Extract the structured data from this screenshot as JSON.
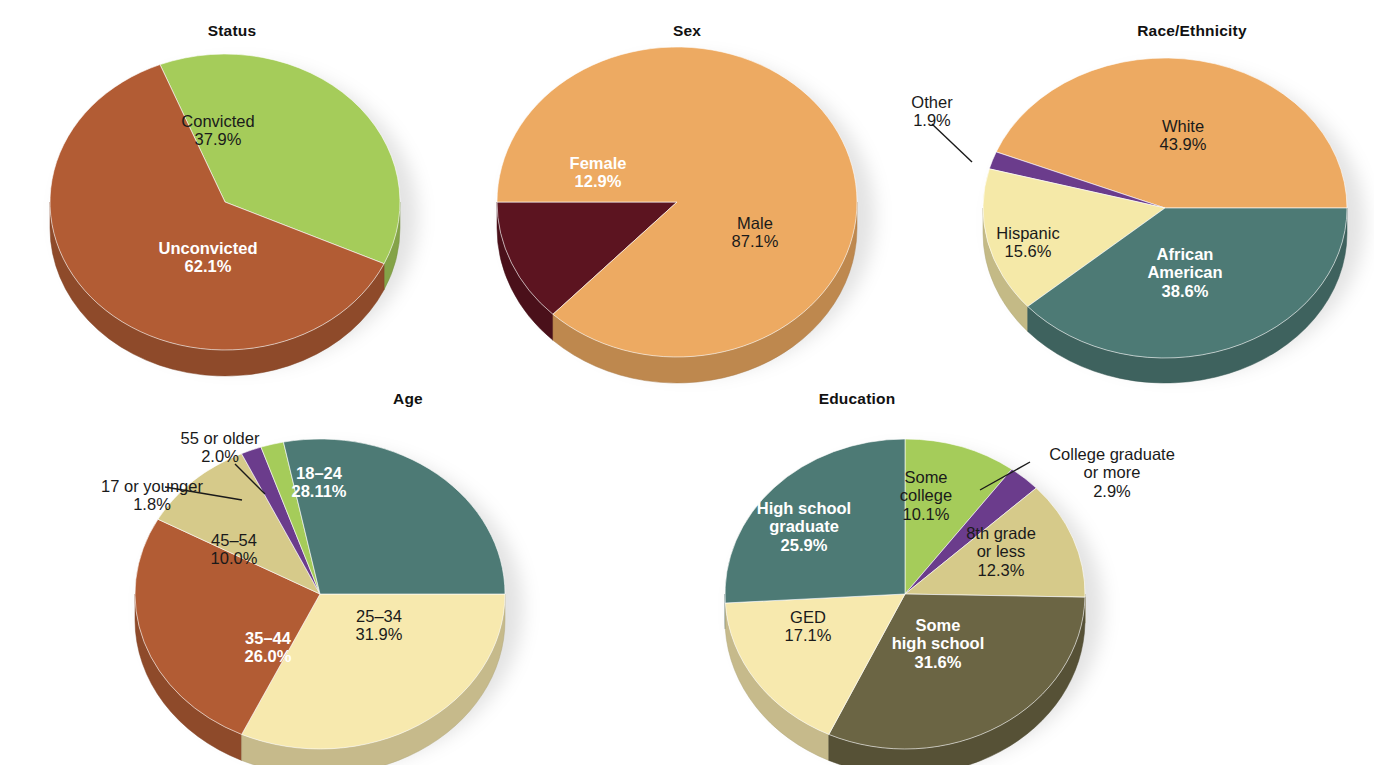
{
  "figure": {
    "background": "#ffffff",
    "palette": {
      "green": "#a5cc5a",
      "brick": "#b25c34",
      "orange": "#edaa62",
      "maroon": "#5c1420",
      "cream": "#f5e9a8",
      "teal": "#4d7a75",
      "purple": "#6b3c8c",
      "khaki": "#d6ca8a",
      "olive": "#6b6544",
      "pale_yellow": "#f7e9ae"
    }
  },
  "chart_data": [
    {
      "type": "pie",
      "id": "status",
      "title": "Status",
      "categories": [
        "Convicted",
        "Unconvicted"
      ],
      "values": [
        37.9,
        62.1
      ],
      "labels": [
        "37.9%",
        "62.1%"
      ],
      "colors": [
        "#a5cc5a",
        "#b25c34"
      ],
      "legend": "none"
    },
    {
      "type": "pie",
      "id": "sex",
      "title": "Sex",
      "categories": [
        "Female",
        "Male"
      ],
      "values": [
        12.9,
        87.1
      ],
      "labels": [
        "12.9%",
        "87.1%"
      ],
      "colors": [
        "#5c1420",
        "#edaa62"
      ],
      "legend": "none"
    },
    {
      "type": "pie",
      "id": "race_ethnicity",
      "title": "Race/Ethnicity",
      "categories": [
        "White",
        "African American",
        "Hispanic",
        "Other"
      ],
      "values": [
        43.9,
        38.6,
        15.6,
        1.9
      ],
      "labels": [
        "43.9%",
        "38.6%",
        "15.6%",
        "1.9%"
      ],
      "colors": [
        "#edaa62",
        "#4d7a75",
        "#f5e9a8",
        "#6b3c8c"
      ],
      "legend": "none"
    },
    {
      "type": "pie",
      "id": "age",
      "title": "Age",
      "categories": [
        "18–24",
        "25–34",
        "35–44",
        "45–54",
        "17 or younger",
        "55 or older"
      ],
      "values": [
        28.11,
        31.9,
        26.0,
        10.0,
        1.8,
        2.0
      ],
      "labels": [
        "28.11%",
        "31.9%",
        "26.0%",
        "10.0%",
        "1.8%",
        "2.0%"
      ],
      "colors": [
        "#4d7a75",
        "#f7e9ae",
        "#b25c34",
        "#d6ca8a",
        "#6b3c8c",
        "#a5cc5a"
      ],
      "legend": "none"
    },
    {
      "type": "pie",
      "id": "education",
      "title": "Education",
      "categories": [
        "Some college",
        "College graduate or more",
        "8th grade or less",
        "Some high school",
        "GED",
        "High school graduate"
      ],
      "values": [
        10.1,
        2.9,
        12.3,
        31.6,
        17.1,
        25.9
      ],
      "labels": [
        "10.1%",
        "2.9%",
        "12.3%",
        "31.6%",
        "17.1%",
        "25.9%"
      ],
      "colors": [
        "#a5cc5a",
        "#6b3c8c",
        "#d6ca8a",
        "#6b6544",
        "#f7e9ae",
        "#4d7a75"
      ],
      "legend": "none"
    }
  ],
  "charts": {
    "status": {
      "title": "Status",
      "slices": {
        "convicted": {
          "name": "Convicted",
          "pct": "37.9%"
        },
        "unconvicted": {
          "name": "Unconvicted",
          "pct": "62.1%"
        }
      }
    },
    "sex": {
      "title": "Sex",
      "slices": {
        "female": {
          "name": "Female",
          "pct": "12.9%"
        },
        "male": {
          "name": "Male",
          "pct": "87.1%"
        }
      }
    },
    "race": {
      "title": "Race/Ethnicity",
      "slices": {
        "white": {
          "name": "White",
          "pct": "43.9%"
        },
        "african_american_l1": {
          "name": "African",
          "pct": ""
        },
        "african_american_l2": {
          "name": "American",
          "pct": "38.6%"
        },
        "hispanic": {
          "name": "Hispanic",
          "pct": "15.6%"
        },
        "other": {
          "name": "Other",
          "pct": "1.9%"
        }
      }
    },
    "age": {
      "title": "Age",
      "slices": {
        "a18_24": {
          "name": "18–24",
          "pct": "28.11%"
        },
        "a25_34": {
          "name": "25–34",
          "pct": "31.9%"
        },
        "a35_44": {
          "name": "35–44",
          "pct": "26.0%"
        },
        "a45_54": {
          "name": "45–54",
          "pct": "10.0%"
        },
        "a17_younger": {
          "name": "17 or younger",
          "pct": "1.8%"
        },
        "a55_older": {
          "name": "55 or older",
          "pct": "2.0%"
        }
      }
    },
    "education": {
      "title": "Education",
      "slices": {
        "some_college_l1": {
          "name": "Some",
          "pct": ""
        },
        "some_college_l2": {
          "name": "college",
          "pct": "10.1%"
        },
        "college_grad_l1": {
          "name": "College graduate",
          "pct": ""
        },
        "college_grad_l2": {
          "name": "or more",
          "pct": "2.9%"
        },
        "grade8_l1": {
          "name": "8th grade",
          "pct": ""
        },
        "grade8_l2": {
          "name": "or less",
          "pct": "12.3%"
        },
        "some_hs_l1": {
          "name": "Some",
          "pct": ""
        },
        "some_hs_l2": {
          "name": "high school",
          "pct": "31.6%"
        },
        "ged": {
          "name": "GED",
          "pct": "17.1%"
        },
        "hs_grad_l1": {
          "name": "High school",
          "pct": ""
        },
        "hs_grad_l2": {
          "name": "graduate",
          "pct": "25.9%"
        }
      }
    }
  }
}
